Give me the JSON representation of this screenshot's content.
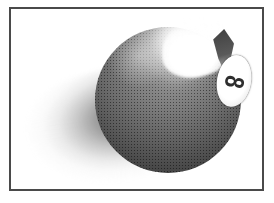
{
  "image": {
    "title": "Eight Ball",
    "subject": "billiard-8-ball",
    "style": "dithered halftone clip art",
    "background_color": "#ffffff"
  },
  "frame": {
    "name": "picture-frame",
    "border_color": "#4a4a4a",
    "border_width_px": 2,
    "inset_left_px": 9,
    "inset_top_px": 7,
    "width_px": 255,
    "height_px": 184
  },
  "artwork": {
    "ball": {
      "name": "eight-ball",
      "base_color": "#6e6e6e",
      "dark_color": "#474747",
      "highlight_color": "#ffffff",
      "diameter_px": 146,
      "center_x_px": 157,
      "center_y_px": 91
    },
    "label": {
      "name": "eight-ball-number-label",
      "number": "8",
      "disc_color": "#ffffff",
      "number_color": "#2e2e2e"
    },
    "highlight": {
      "name": "specular-highlight",
      "color": "#ffffff"
    },
    "shadow": {
      "name": "cast-shadow",
      "color": "#6e6e6e",
      "direction": "lower-left"
    }
  }
}
